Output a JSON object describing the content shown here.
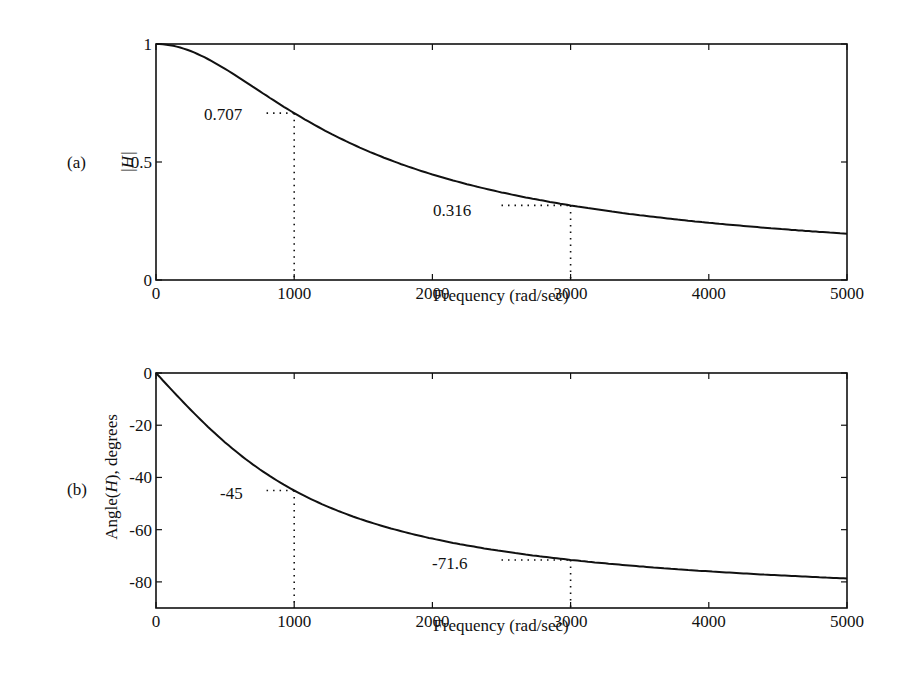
{
  "chart_data": [
    {
      "panel_label": "(a)",
      "type": "line",
      "title": "",
      "xlabel": "Frequency (rad/sec)",
      "ylabel": "|H|",
      "xlim": [
        0,
        5000
      ],
      "ylim": [
        0,
        1
      ],
      "x_ticks": [
        "0",
        "1000",
        "2000",
        "3000",
        "4000",
        "5000"
      ],
      "y_ticks": [
        "0",
        "0.5",
        "1"
      ],
      "grid": false,
      "series": [
        {
          "name": "|H|",
          "x": [
            0,
            250,
            500,
            750,
            1000,
            1500,
            2000,
            2500,
            3000,
            3500,
            4000,
            4500,
            5000
          ],
          "values": [
            1.0,
            0.97,
            0.894,
            0.8,
            0.707,
            0.555,
            0.447,
            0.371,
            0.316,
            0.275,
            0.243,
            0.217,
            0.196
          ]
        }
      ],
      "annotations": [
        {
          "label": "0.707",
          "x": 1000,
          "y": 0.707
        },
        {
          "label": "0.316",
          "x": 3000,
          "y": 0.316
        }
      ]
    },
    {
      "panel_label": "(b)",
      "type": "line",
      "title": "",
      "xlabel": "Frequency (rad/sec)",
      "ylabel": "Angle(H), degrees",
      "xlim": [
        0,
        5000
      ],
      "ylim": [
        -90,
        0
      ],
      "x_ticks": [
        "0",
        "1000",
        "2000",
        "3000",
        "4000",
        "5000"
      ],
      "y_ticks": [
        "0",
        "-20",
        "-40",
        "-60",
        "-80"
      ],
      "grid": false,
      "series": [
        {
          "name": "Angle(H)",
          "x": [
            0,
            250,
            500,
            750,
            1000,
            1500,
            2000,
            2500,
            3000,
            3500,
            4000,
            4500,
            5000
          ],
          "values": [
            0,
            -14.0,
            -26.6,
            -36.9,
            -45.0,
            -56.3,
            -63.4,
            -68.2,
            -71.6,
            -74.1,
            -76.0,
            -77.5,
            -78.7
          ]
        }
      ],
      "annotations": [
        {
          "label": "-45",
          "x": 1000,
          "y": -45
        },
        {
          "label": "-71.6",
          "x": 3000,
          "y": -71.6
        }
      ]
    }
  ],
  "labels": {
    "a": {
      "panel": "(a)",
      "ylabel": "|H|",
      "xlabel": "Frequency (rad/sec)",
      "ann1": "0.707",
      "ann2": "0.316",
      "yt": [
        "0",
        "0.5",
        "1"
      ],
      "xt": [
        "0",
        "1000",
        "2000",
        "3000",
        "4000",
        "5000"
      ]
    },
    "b": {
      "panel": "(b)",
      "ylabel": "Angle(H), degrees",
      "xlabel": "Frequency (rad/sec)",
      "ann1": "-45",
      "ann2": "-71.6",
      "yt": [
        "0",
        "-20",
        "-40",
        "-60",
        "-80"
      ],
      "xt": [
        "0",
        "1000",
        "2000",
        "3000",
        "4000",
        "5000"
      ]
    }
  }
}
